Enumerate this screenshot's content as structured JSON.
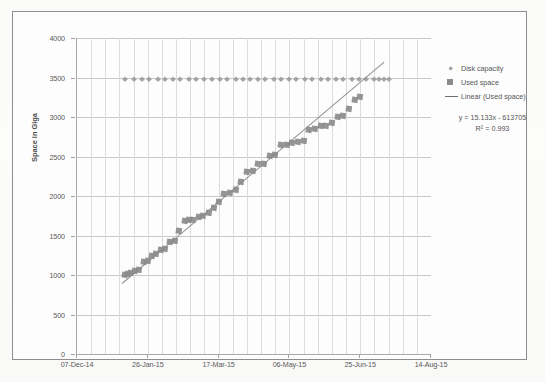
{
  "chart_data": {
    "type": "scatter",
    "title": "",
    "xlabel": "",
    "ylabel": "Space in Giga",
    "ylim": [
      0,
      4000
    ],
    "ytick_labels": [
      "4000",
      "3500",
      "3000",
      "2500",
      "2000",
      "1500",
      "1000",
      "500",
      "0"
    ],
    "ytick_values": [
      4000,
      3500,
      3000,
      2500,
      2000,
      1500,
      1000,
      500,
      0
    ],
    "xtick_labels": [
      "07-Dec-14",
      "26-Jan-15",
      "17-Mar-15",
      "06-May-15",
      "25-Jun-15",
      "14-Aug-15"
    ],
    "xtick_days": [
      0,
      50,
      100,
      150,
      200,
      250
    ],
    "xlim_days": [
      0,
      250
    ],
    "grid": "horizontal-and-vertical",
    "legend_position": "right",
    "annotations": [
      "y = 15.133x - 613705",
      "R² = 0.993"
    ],
    "trendline": {
      "label": "Linear (Used space)",
      "equation": "y = 15.133x - 613705",
      "r_squared": "R² = 0.993",
      "slope_per_day": 15.133,
      "x_start_day": 32,
      "y_start": 900,
      "x_end_day": 217,
      "y_end": 3700
    },
    "series": [
      {
        "name": "Disk capacity",
        "marker": "diamond",
        "color": "#9b9b9b",
        "x": [
          34,
          40,
          46,
          51,
          57,
          62,
          68,
          73,
          79,
          84,
          90,
          95,
          101,
          106,
          112,
          117,
          122,
          128,
          133,
          139,
          144,
          150,
          155,
          161,
          166,
          172,
          177,
          183,
          188,
          194,
          199,
          204,
          210,
          213,
          217,
          220
        ],
        "values": [
          3480,
          3480,
          3480,
          3480,
          3480,
          3480,
          3480,
          3480,
          3480,
          3480,
          3480,
          3480,
          3480,
          3480,
          3480,
          3480,
          3480,
          3480,
          3480,
          3480,
          3480,
          3480,
          3480,
          3480,
          3480,
          3480,
          3480,
          3480,
          3480,
          3480,
          3480,
          3480,
          3480,
          3480,
          3480,
          3480
        ]
      },
      {
        "name": "Used space",
        "marker": "square",
        "color": "#8b8b8b",
        "x": [
          34,
          36,
          38,
          41,
          44,
          47,
          50,
          53,
          56,
          59,
          62,
          66,
          69,
          72,
          76,
          79,
          82,
          86,
          89,
          93,
          97,
          100,
          104,
          108,
          112,
          116,
          120,
          124,
          128,
          132,
          136,
          140,
          144,
          148,
          152,
          156,
          160,
          164,
          168,
          172,
          176,
          180,
          184,
          188,
          192,
          196,
          200
        ],
        "values": [
          1000,
          1010,
          1020,
          1050,
          1060,
          1170,
          1180,
          1240,
          1260,
          1320,
          1330,
          1420,
          1430,
          1560,
          1680,
          1690,
          1700,
          1740,
          1750,
          1780,
          1850,
          1930,
          2030,
          2040,
          2080,
          2180,
          2310,
          2320,
          2400,
          2410,
          2510,
          2520,
          2640,
          2650,
          2670,
          2680,
          2700,
          2840,
          2850,
          2880,
          2890,
          2930,
          3000,
          3010,
          3100,
          3210,
          3250
        ]
      }
    ]
  },
  "legend": {
    "items": [
      {
        "label": "Disk capacity",
        "marker": "diamond"
      },
      {
        "label": "Used space",
        "marker": "square"
      },
      {
        "label": "Linear (Used space)",
        "marker": "line"
      }
    ]
  }
}
